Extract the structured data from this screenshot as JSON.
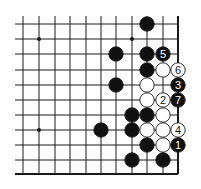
{
  "diagram": {
    "type": "go-board-fragment",
    "grid": {
      "cols": 11,
      "rows": 11,
      "x": [
        23,
        39,
        55,
        70,
        86,
        101,
        116,
        132,
        147,
        163,
        178
      ],
      "y": [
        24,
        39,
        54,
        70,
        85,
        100,
        115,
        130,
        145,
        160,
        174
      ],
      "open_left": true,
      "open_top": true,
      "edge_right": true,
      "edge_bottom": true
    },
    "star_points": [
      {
        "col": 1,
        "row": 1
      },
      {
        "col": 7,
        "row": 1
      },
      {
        "col": 1,
        "row": 7
      }
    ],
    "stones": [
      {
        "color": "black",
        "col": 8,
        "row": 0,
        "label": ""
      },
      {
        "color": "black",
        "col": 6,
        "row": 2,
        "label": ""
      },
      {
        "color": "black",
        "col": 8,
        "row": 2,
        "label": ""
      },
      {
        "color": "black",
        "col": 9,
        "row": 2,
        "label": "5"
      },
      {
        "color": "black",
        "col": 8,
        "row": 3,
        "label": ""
      },
      {
        "color": "white",
        "col": 9,
        "row": 3,
        "label": ""
      },
      {
        "color": "white",
        "col": 10,
        "row": 3,
        "label": "6"
      },
      {
        "color": "black",
        "col": 6,
        "row": 4,
        "label": ""
      },
      {
        "color": "white",
        "col": 8,
        "row": 4,
        "label": ""
      },
      {
        "color": "black",
        "col": 10,
        "row": 4,
        "label": "3"
      },
      {
        "color": "white",
        "col": 8,
        "row": 5,
        "label": ""
      },
      {
        "color": "white",
        "col": 9,
        "row": 5,
        "label": "2"
      },
      {
        "color": "black",
        "col": 10,
        "row": 5,
        "label": "7"
      },
      {
        "color": "black",
        "col": 7,
        "row": 6,
        "label": ""
      },
      {
        "color": "black",
        "col": 8,
        "row": 6,
        "label": ""
      },
      {
        "color": "white",
        "col": 9,
        "row": 6,
        "label": ""
      },
      {
        "color": "black",
        "col": 5,
        "row": 7,
        "label": ""
      },
      {
        "color": "black",
        "col": 7,
        "row": 7,
        "label": ""
      },
      {
        "color": "white",
        "col": 8,
        "row": 7,
        "label": ""
      },
      {
        "color": "white",
        "col": 9,
        "row": 7,
        "label": ""
      },
      {
        "color": "white",
        "col": 10,
        "row": 7,
        "label": "4"
      },
      {
        "color": "black",
        "col": 8,
        "row": 8,
        "label": ""
      },
      {
        "color": "white",
        "col": 9,
        "row": 8,
        "label": ""
      },
      {
        "color": "black",
        "col": 10,
        "row": 8,
        "label": "1"
      },
      {
        "color": "black",
        "col": 7,
        "row": 9,
        "label": ""
      },
      {
        "color": "black",
        "col": 9,
        "row": 9,
        "label": ""
      }
    ],
    "colors": {
      "line": "#1a1a1a",
      "black_stone": "#111111",
      "white_stone": "#ffffff",
      "background": "#ffffff"
    }
  }
}
